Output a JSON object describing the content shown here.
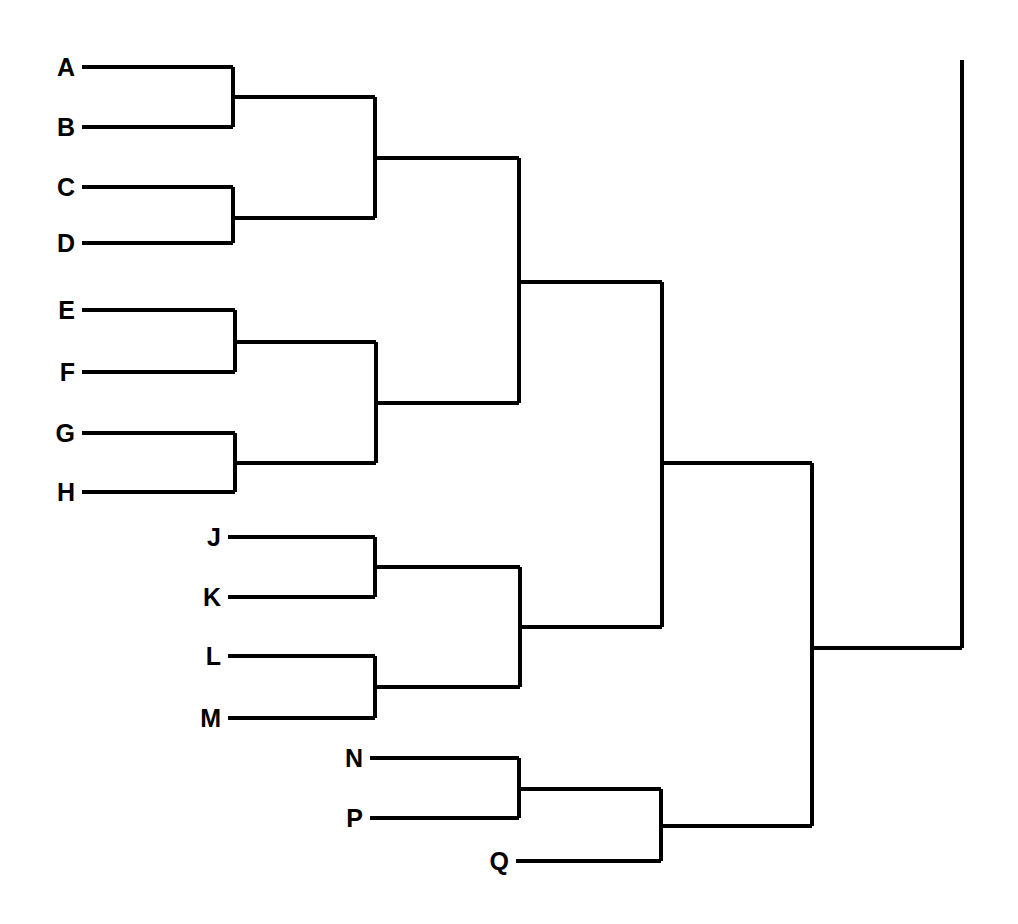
{
  "figure": {
    "kind": "dendrogram",
    "orientation": "horizontal-left-to-right",
    "background_color": "#ffffff",
    "line_color": "#000000",
    "label_color": "#000000",
    "line_width": 4,
    "width": 1018,
    "height": 924
  },
  "chart_data": {
    "type": "dendrogram",
    "title": "",
    "xlabel": "",
    "ylabel": "",
    "leaf_labels": [
      "A",
      "B",
      "C",
      "D",
      "E",
      "F",
      "G",
      "H",
      "J",
      "K",
      "L",
      "M",
      "N",
      "P",
      "Q"
    ],
    "leaves": [
      {
        "label": "A",
        "y": 67,
        "x_start": 82,
        "x_end": 233
      },
      {
        "label": "B",
        "y": 127,
        "x_start": 82,
        "x_end": 233
      },
      {
        "label": "C",
        "y": 187,
        "x_start": 82,
        "x_end": 233
      },
      {
        "label": "D",
        "y": 243,
        "x_start": 82,
        "x_end": 233
      },
      {
        "label": "E",
        "y": 310,
        "x_start": 82,
        "x_end": 235
      },
      {
        "label": "F",
        "y": 372,
        "x_start": 82,
        "x_end": 235
      },
      {
        "label": "G",
        "y": 433,
        "x_start": 82,
        "x_end": 235
      },
      {
        "label": "H",
        "y": 492,
        "x_start": 82,
        "x_end": 235
      },
      {
        "label": "J",
        "y": 537,
        "x_start": 228,
        "x_end": 375
      },
      {
        "label": "K",
        "y": 597,
        "x_start": 228,
        "x_end": 375
      },
      {
        "label": "L",
        "y": 656,
        "x_start": 228,
        "x_end": 375
      },
      {
        "label": "M",
        "y": 718,
        "x_start": 228,
        "x_end": 375
      },
      {
        "label": "N",
        "y": 758,
        "x_start": 370,
        "x_end": 519
      },
      {
        "label": "P",
        "y": 818,
        "x_start": 370,
        "x_end": 519
      },
      {
        "label": "Q",
        "y": 861,
        "x_start": 516,
        "x_end": 661
      }
    ],
    "merges": [
      {
        "name": "AB",
        "children": [
          "A",
          "B"
        ],
        "x": 233,
        "y_top": 67,
        "y_bottom": 127,
        "y_mid": 97,
        "parent_x": 375
      },
      {
        "name": "CD",
        "children": [
          "C",
          "D"
        ],
        "x": 233,
        "y_top": 187,
        "y_bottom": 243,
        "y_mid": 218,
        "parent_x": 375
      },
      {
        "name": "ABCD",
        "children": [
          "AB",
          "CD"
        ],
        "x": 375,
        "y_top": 97,
        "y_bottom": 218,
        "y_mid": 158,
        "parent_x": 519
      },
      {
        "name": "EF",
        "children": [
          "E",
          "F"
        ],
        "x": 235,
        "y_top": 310,
        "y_bottom": 372,
        "y_mid": 342,
        "parent_x": 376
      },
      {
        "name": "GH",
        "children": [
          "G",
          "H"
        ],
        "x": 235,
        "y_top": 433,
        "y_bottom": 492,
        "y_mid": 463,
        "parent_x": 376
      },
      {
        "name": "EFGH",
        "children": [
          "EF",
          "GH"
        ],
        "x": 376,
        "y_top": 342,
        "y_bottom": 463,
        "y_mid": 403,
        "parent_x": 519
      },
      {
        "name": "ABCDEFGH",
        "children": [
          "ABCD",
          "EFGH"
        ],
        "x": 519,
        "y_top": 158,
        "y_bottom": 403,
        "y_mid": 282,
        "parent_x": 662
      },
      {
        "name": "JK",
        "children": [
          "J",
          "K"
        ],
        "x": 375,
        "y_top": 537,
        "y_bottom": 597,
        "y_mid": 567,
        "parent_x": 520
      },
      {
        "name": "LM",
        "children": [
          "L",
          "M"
        ],
        "x": 375,
        "y_top": 656,
        "y_bottom": 718,
        "y_mid": 687,
        "parent_x": 520
      },
      {
        "name": "JKLM",
        "children": [
          "JK",
          "LM"
        ],
        "x": 520,
        "y_top": 567,
        "y_bottom": 687,
        "y_mid": 627,
        "parent_x": 662
      },
      {
        "name": "ABCDEFGH-JKLM",
        "children": [
          "ABCDEFGH",
          "JKLM"
        ],
        "x": 662,
        "y_top": 282,
        "y_bottom": 627,
        "y_mid": 463,
        "parent_x": 812
      },
      {
        "name": "NP",
        "children": [
          "N",
          "P"
        ],
        "x": 519,
        "y_top": 758,
        "y_bottom": 818,
        "y_mid": 789,
        "parent_x": 661
      },
      {
        "name": "NPQ",
        "children": [
          "NP",
          "Q"
        ],
        "x": 661,
        "y_top": 789,
        "y_bottom": 861,
        "y_mid": 826,
        "parent_x": 812
      },
      {
        "name": "UPPER-NPQ",
        "children": [
          "ABCDEFGH-JKLM",
          "NPQ"
        ],
        "x": 812,
        "y_top": 463,
        "y_bottom": 826,
        "y_mid": 648,
        "parent_x": 962
      },
      {
        "name": "ROOT",
        "children": [
          "UPPER-NPQ"
        ],
        "x": 962,
        "y_top": 60,
        "y_bottom": 648,
        "y_mid": 648,
        "parent_x": null
      }
    ],
    "cluster_structure": "(((A,B),(C,D)),((E,F),(G,H))) + ((J,K),(L,M)) + ((N,P),Q)",
    "n_leaves": 15,
    "grid": false,
    "legend": "none",
    "axis_ticks": []
  }
}
